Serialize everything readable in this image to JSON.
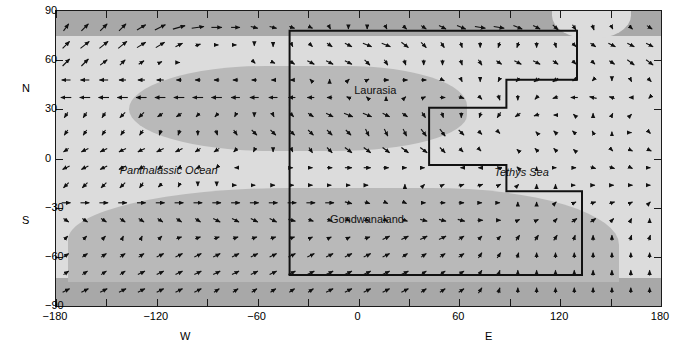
{
  "chart_data": {
    "type": "quiver",
    "title": "",
    "xlabel_left": "W",
    "xlabel_right": "E",
    "ylabel_north": "N",
    "ylabel_south": "S",
    "xlim": [
      -180,
      180
    ],
    "ylim": [
      -90,
      90
    ],
    "xticks": [
      -180,
      -150,
      -120,
      -90,
      -60,
      -30,
      0,
      30,
      60,
      90,
      120,
      150,
      180
    ],
    "xtick_labels": [
      "-180",
      "",
      "-120",
      "",
      "-60",
      "",
      "0",
      "",
      "60",
      "",
      "120",
      "",
      "180"
    ],
    "yticks": [
      -90,
      -60,
      -30,
      0,
      30,
      60,
      90
    ],
    "ytick_labels": [
      "-90",
      "-60",
      "-30",
      "0",
      "30",
      "60",
      "90"
    ],
    "grid": false,
    "legend": "none",
    "annotations": [
      {
        "text": "Laurasia",
        "x": 10,
        "y": 42,
        "style": "upright"
      },
      {
        "text": "Panthalassic Ocean",
        "x": -113,
        "y": -7,
        "style": "italic"
      },
      {
        "text": "Tethys Sea",
        "x": 97,
        "y": -8,
        "style": "italic"
      },
      {
        "text": "Gondwanaland",
        "x": 5,
        "y": -37,
        "style": "upright"
      }
    ],
    "regions": [
      {
        "name": "north-polar-band",
        "lat_range": [
          75,
          90
        ],
        "shade": "#a8a8a8"
      },
      {
        "name": "south-polar-band",
        "lat_range": [
          -90,
          -74
        ],
        "shade": "#a8a8a8"
      },
      {
        "name": "ocean",
        "lat_range": [
          -74,
          75
        ],
        "shade": "#dcdcdc"
      },
      {
        "name": "laurasia-landmass",
        "shade": "#b9b9b9"
      },
      {
        "name": "gondwanaland-landmass",
        "shade": "#b9b9b9"
      }
    ],
    "pangea_outline": {
      "stroke": "#111111",
      "vertices_deg": [
        [
          -41,
          78
        ],
        [
          130,
          78
        ],
        [
          130,
          48
        ],
        [
          88,
          48
        ],
        [
          88,
          31
        ],
        [
          42,
          31
        ],
        [
          42,
          -4
        ],
        [
          88,
          -4
        ],
        [
          88,
          -20
        ],
        [
          133,
          -20
        ],
        [
          133,
          -71
        ],
        [
          -41,
          -71
        ]
      ]
    },
    "vector_field": {
      "nx": 32,
      "ny": 16,
      "x_start": -174,
      "x_step": 11.2,
      "y_start": 80,
      "y_step": -10.7,
      "description": "Atmospheric wind vectors over Pangea reconstruction",
      "u": [
        [
          3,
          4,
          4,
          4,
          5,
          6,
          7,
          7,
          6,
          5,
          4,
          4,
          3,
          2,
          1,
          0,
          0,
          1,
          2,
          3,
          4,
          5,
          6,
          6,
          5,
          4,
          3,
          2,
          1,
          1,
          2,
          3
        ],
        [
          4,
          5,
          5,
          5,
          5,
          5,
          4,
          3,
          2,
          1,
          0,
          0,
          1,
          2,
          3,
          4,
          5,
          5,
          4,
          3,
          2,
          1,
          0,
          -1,
          -1,
          0,
          1,
          2,
          3,
          4,
          4,
          4
        ],
        [
          4,
          4,
          4,
          3,
          3,
          2,
          1,
          0,
          0,
          0,
          1,
          2,
          3,
          4,
          4,
          4,
          3,
          2,
          1,
          0,
          0,
          1,
          2,
          3,
          4,
          4,
          3,
          2,
          2,
          3,
          4,
          4
        ],
        [
          -5,
          -5,
          -5,
          -4,
          -4,
          -4,
          -3,
          -3,
          -3,
          -3,
          -3,
          -2,
          -2,
          -1,
          0,
          1,
          2,
          3,
          3,
          3,
          2,
          1,
          0,
          -1,
          -2,
          -3,
          -3,
          -2,
          -1,
          0,
          1,
          2
        ],
        [
          -6,
          -6,
          -6,
          -6,
          -6,
          -6,
          -6,
          -6,
          -6,
          -5,
          -5,
          -5,
          -4,
          -4,
          -3,
          -2,
          -1,
          0,
          1,
          2,
          3,
          3,
          2,
          1,
          0,
          -2,
          -3,
          -4,
          -4,
          -3,
          -2,
          -1
        ],
        [
          -2,
          -2,
          -2,
          -3,
          -3,
          -3,
          -3,
          -2,
          -2,
          -1,
          0,
          1,
          2,
          3,
          4,
          5,
          5,
          4,
          3,
          2,
          1,
          0,
          -1,
          -2,
          -3,
          -3,
          -2,
          -1,
          0,
          1,
          1,
          0
        ],
        [
          -2,
          -2,
          -2,
          -2,
          -2,
          -1,
          -1,
          0,
          1,
          2,
          3,
          3,
          3,
          3,
          3,
          3,
          2,
          2,
          2,
          3,
          3,
          3,
          2,
          1,
          0,
          -1,
          -2,
          -2,
          -1,
          0,
          1,
          1
        ],
        [
          -3,
          -4,
          -4,
          -4,
          -4,
          -4,
          -4,
          -3,
          -3,
          -2,
          -1,
          0,
          1,
          2,
          3,
          4,
          4,
          4,
          4,
          4,
          3,
          2,
          1,
          0,
          -1,
          -2,
          -2,
          -1,
          0,
          1,
          2,
          2
        ],
        [
          -4,
          -4,
          -4,
          -4,
          -3,
          -3,
          -2,
          -2,
          -1,
          -1,
          0,
          0,
          1,
          2,
          3,
          4,
          4,
          3,
          2,
          1,
          0,
          -1,
          -2,
          -2,
          -1,
          0,
          1,
          2,
          3,
          3,
          2,
          1
        ],
        [
          -3,
          -3,
          -3,
          -3,
          -2,
          -2,
          -1,
          0,
          0,
          1,
          1,
          2,
          2,
          2,
          2,
          2,
          1,
          0,
          0,
          1,
          2,
          3,
          3,
          2,
          1,
          0,
          0,
          1,
          2,
          2,
          2,
          1
        ],
        [
          5,
          5,
          5,
          5,
          5,
          5,
          5,
          5,
          5,
          5,
          5,
          5,
          5,
          5,
          5,
          4,
          3,
          2,
          2,
          2,
          3,
          3,
          2,
          1,
          0,
          0,
          1,
          2,
          3,
          3,
          2,
          1
        ],
        [
          3,
          3,
          3,
          3,
          3,
          3,
          3,
          3,
          4,
          4,
          4,
          4,
          4,
          3,
          3,
          2,
          2,
          2,
          3,
          4,
          4,
          4,
          3,
          2,
          2,
          2,
          2,
          3,
          3,
          2,
          1,
          0
        ],
        [
          2,
          2,
          2,
          1,
          1,
          2,
          3,
          3,
          3,
          3,
          3,
          3,
          3,
          2,
          2,
          2,
          3,
          4,
          4,
          4,
          4,
          3,
          2,
          2,
          2,
          2,
          2,
          1,
          0,
          0,
          1,
          1
        ],
        [
          3,
          3,
          3,
          3,
          3,
          4,
          4,
          4,
          4,
          4,
          4,
          4,
          4,
          4,
          4,
          4,
          4,
          4,
          3,
          3,
          3,
          3,
          2,
          2,
          1,
          0,
          0,
          0,
          0,
          0,
          0,
          0
        ],
        [
          3,
          3,
          3,
          3,
          4,
          4,
          4,
          4,
          4,
          4,
          4,
          4,
          4,
          4,
          4,
          4,
          4,
          4,
          4,
          3,
          3,
          3,
          2,
          1,
          0,
          0,
          0,
          0,
          0,
          0,
          0,
          0
        ],
        [
          4,
          4,
          4,
          4,
          4,
          4,
          4,
          4,
          3,
          3,
          3,
          3,
          3,
          3,
          4,
          4,
          4,
          4,
          4,
          3,
          3,
          3,
          2,
          1,
          0,
          0,
          0,
          0,
          0,
          0,
          0,
          0
        ]
      ],
      "v": [
        [
          4,
          4,
          4,
          4,
          3,
          3,
          2,
          1,
          0,
          0,
          -1,
          -1,
          -1,
          -1,
          -2,
          -2,
          -2,
          -2,
          -2,
          -2,
          -2,
          -2,
          -1,
          -1,
          -2,
          -2,
          -3,
          -3,
          -3,
          -2,
          -2,
          -2
        ],
        [
          4,
          4,
          4,
          4,
          3,
          3,
          2,
          1,
          0,
          0,
          -1,
          -2,
          -2,
          -2,
          -2,
          -2,
          -2,
          -2,
          -3,
          -3,
          -3,
          -3,
          -3,
          -3,
          -3,
          -3,
          -3,
          -2,
          -2,
          -2,
          -2,
          -2
        ],
        [
          4,
          4,
          3,
          3,
          2,
          1,
          0,
          0,
          0,
          0,
          -1,
          -1,
          -2,
          -2,
          -2,
          -2,
          -3,
          -3,
          -3,
          -3,
          -3,
          -3,
          -3,
          -2,
          -2,
          -2,
          -2,
          -2,
          -2,
          -2,
          -3,
          -3
        ],
        [
          0,
          0,
          0,
          0,
          0,
          0,
          0,
          0,
          0,
          0,
          0,
          0,
          0,
          1,
          1,
          1,
          1,
          0,
          0,
          0,
          -1,
          -2,
          -2,
          -2,
          -2,
          -2,
          -2,
          -1,
          -1,
          -1,
          -2,
          -2
        ],
        [
          0,
          0,
          0,
          0,
          0,
          0,
          0,
          0,
          0,
          0,
          0,
          0,
          0,
          0,
          0,
          1,
          1,
          1,
          1,
          1,
          0,
          -1,
          -2,
          -3,
          -3,
          -2,
          -1,
          0,
          1,
          1,
          0,
          -1
        ],
        [
          -3,
          -3,
          -3,
          -3,
          -3,
          -2,
          -2,
          -2,
          -2,
          -2,
          -2,
          -2,
          -2,
          -2,
          -2,
          -2,
          -2,
          -2,
          -2,
          -3,
          -3,
          -3,
          -3,
          -3,
          -2,
          -1,
          0,
          1,
          2,
          2,
          1,
          0
        ],
        [
          -3,
          -3,
          -3,
          -3,
          -3,
          -3,
          -3,
          -3,
          -3,
          -3,
          -3,
          -3,
          -3,
          -3,
          -3,
          -3,
          -4,
          -4,
          -4,
          -4,
          -4,
          -3,
          -2,
          -1,
          0,
          1,
          2,
          2,
          2,
          1,
          0,
          -1
        ],
        [
          -2,
          -2,
          -2,
          -2,
          -2,
          -2,
          -2,
          -2,
          -2,
          -2,
          -2,
          -2,
          -2,
          -3,
          -3,
          -3,
          -3,
          -3,
          -3,
          -3,
          -3,
          -2,
          -1,
          0,
          1,
          2,
          2,
          1,
          0,
          -1,
          -1,
          -1
        ],
        [
          -2,
          -2,
          -2,
          -2,
          -2,
          -2,
          -1,
          -1,
          -1,
          0,
          0,
          0,
          0,
          0,
          0,
          0,
          0,
          0,
          0,
          0,
          0,
          0,
          0,
          1,
          1,
          1,
          0,
          0,
          -1,
          -1,
          -1,
          0
        ],
        [
          -3,
          -3,
          -3,
          -3,
          -3,
          -2,
          -2,
          -1,
          -1,
          0,
          0,
          0,
          0,
          0,
          0,
          0,
          0,
          0,
          1,
          1,
          1,
          1,
          1,
          1,
          1,
          1,
          1,
          0,
          0,
          0,
          0,
          0
        ],
        [
          0,
          0,
          0,
          0,
          0,
          0,
          0,
          0,
          0,
          0,
          0,
          0,
          0,
          0,
          0,
          -1,
          -1,
          -1,
          -1,
          0,
          0,
          0,
          0,
          0,
          1,
          1,
          1,
          1,
          1,
          1,
          1,
          1
        ],
        [
          -2,
          -2,
          -2,
          -2,
          -2,
          -2,
          -2,
          -2,
          -2,
          -2,
          -2,
          -2,
          -1,
          -1,
          -1,
          -1,
          -1,
          -1,
          -1,
          -1,
          -1,
          -1,
          0,
          0,
          1,
          1,
          2,
          2,
          2,
          2,
          2,
          2
        ],
        [
          2,
          2,
          2,
          2,
          2,
          2,
          1,
          1,
          1,
          1,
          1,
          1,
          1,
          1,
          1,
          1,
          1,
          2,
          2,
          2,
          2,
          2,
          2,
          2,
          3,
          3,
          3,
          3,
          3,
          3,
          3,
          3
        ],
        [
          2,
          2,
          2,
          2,
          2,
          2,
          2,
          2,
          2,
          2,
          2,
          2,
          2,
          2,
          2,
          2,
          2,
          2,
          2,
          2,
          2,
          2,
          3,
          3,
          3,
          3,
          3,
          3,
          3,
          3,
          3,
          3
        ],
        [
          2,
          2,
          2,
          2,
          2,
          2,
          2,
          2,
          2,
          2,
          2,
          2,
          2,
          2,
          2,
          2,
          2,
          2,
          2,
          2,
          2,
          2,
          3,
          3,
          3,
          3,
          3,
          3,
          3,
          3,
          3,
          3
        ],
        [
          2,
          2,
          2,
          2,
          2,
          2,
          2,
          2,
          2,
          2,
          2,
          2,
          2,
          2,
          2,
          2,
          2,
          2,
          2,
          2,
          2,
          2,
          3,
          3,
          3,
          3,
          3,
          3,
          3,
          3,
          3,
          3
        ]
      ]
    }
  }
}
